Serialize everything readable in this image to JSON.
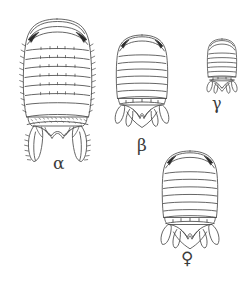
{
  "plate": {
    "title": "Comparative dorsal views of four isopod specimen morphs",
    "background_color": "#ffffff",
    "ink_color": "#4a4a4a",
    "eye_color": "#2b2b2b",
    "width": 249,
    "height": 284,
    "figure_count": 4
  },
  "figures": [
    {
      "id": "alpha",
      "label": "α",
      "label_name": "alpha",
      "size_rank": "largest",
      "description": "Large dorsal view with marginal spines, dark crescent eyes, seven pereonites and long paired spiny uropods",
      "segment_count": 7,
      "has_marginal_spines": true,
      "has_long_uropods": true,
      "bounds": {
        "x": 18,
        "y": 18,
        "width": 80,
        "height": 133
      },
      "label_position": {
        "x": 53,
        "y": 155
      }
    },
    {
      "id": "beta",
      "label": "β",
      "label_name": "beta",
      "size_rank": "medium",
      "description": "Medium dorsal view with smooth margins, dark eyes and leaf-shaped uropod lobes",
      "segment_count": 7,
      "has_marginal_spines": false,
      "has_long_uropods": false,
      "bounds": {
        "x": 108,
        "y": 34,
        "width": 68,
        "height": 100
      },
      "label_position": {
        "x": 137,
        "y": 137
      }
    },
    {
      "id": "gamma",
      "label": "γ",
      "label_name": "gamma",
      "size_rank": "smallest",
      "description": "Small compact dorsal view with narrow oval body and reduced uropods",
      "segment_count": 7,
      "has_marginal_spines": false,
      "has_long_uropods": false,
      "bounds": {
        "x": 203,
        "y": 38,
        "width": 38,
        "height": 55
      },
      "label_position": {
        "x": 212,
        "y": 96
      }
    },
    {
      "id": "female",
      "label": "♀",
      "label_name": "female-venus-symbol",
      "size_rank": "medium-large",
      "description": "Female dorsal view, broadly oval with dark eyes and leaf-shaped uropod lobes",
      "segment_count": 7,
      "has_marginal_spines": false,
      "has_long_uropods": false,
      "bounds": {
        "x": 152,
        "y": 150,
        "width": 76,
        "height": 96
      },
      "label_position": {
        "x": 181,
        "y": 250
      }
    }
  ]
}
